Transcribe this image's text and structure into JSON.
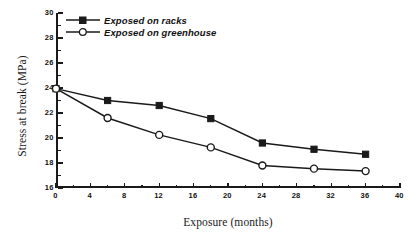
{
  "chart_data": {
    "type": "line",
    "title": "",
    "xlabel": "Exposure (months)",
    "ylabel": "Stress at break (MPa)",
    "xlim": [
      0,
      40
    ],
    "ylim": [
      16,
      30
    ],
    "x_ticks": [
      0,
      4,
      8,
      12,
      16,
      20,
      24,
      28,
      32,
      36,
      40
    ],
    "y_ticks": [
      16,
      18,
      20,
      22,
      24,
      26,
      28,
      30
    ],
    "x_minor_ticks": [
      2,
      6,
      10,
      14,
      18,
      22,
      26,
      30,
      34,
      38
    ],
    "y_minor_ticks": [
      17,
      19,
      21,
      23,
      25,
      27,
      29
    ],
    "x": [
      0,
      6,
      12,
      18,
      24,
      30,
      36
    ],
    "grid": false,
    "legend_position": "top-left",
    "series": [
      {
        "name": "Exposed on racks",
        "marker": "filled-square",
        "color": "#1a1a1a",
        "values": [
          23.95,
          23.0,
          22.6,
          21.55,
          19.6,
          19.1,
          18.7
        ]
      },
      {
        "name": "Exposed on greenhouse",
        "marker": "open-circle",
        "color": "#1a1a1a",
        "values": [
          23.95,
          21.6,
          20.25,
          19.25,
          17.8,
          17.55,
          17.35
        ]
      }
    ]
  },
  "legend": {
    "items": [
      {
        "label": "Exposed on racks",
        "marker": "filled-square"
      },
      {
        "label": "Exposed on greenhouse",
        "marker": "open-circle"
      }
    ]
  },
  "axes": {
    "x_title": "Exposure (months)",
    "y_title": "Stress at break (MPa)"
  }
}
